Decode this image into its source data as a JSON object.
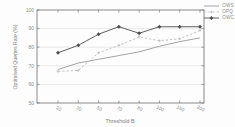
{
  "chart": {
    "xlabel": "Threshold B",
    "ylabel": "Optimised Queries Rate  (%)"
  },
  "chart_data": {
    "type": "line",
    "x": [
      20,
      30,
      50,
      70,
      80,
      100,
      150,
      200
    ],
    "x_tick_labels": [
      "20",
      "30",
      "50",
      "70",
      "80",
      "100",
      "150",
      "200"
    ],
    "xlabel": "Threshold B",
    "ylabel": "Optimised Queries Rate  (%)",
    "ylim": [
      50,
      100
    ],
    "yticks": [
      50,
      60,
      70,
      80,
      90,
      100
    ],
    "grid": true,
    "legend_position": "top-right-outside",
    "series": [
      {
        "name": "OWS",
        "values": [
          68,
          71.5,
          73.5,
          75.5,
          77.5,
          80.5,
          83,
          85
        ],
        "color": "#9a9a9a",
        "style": "solid",
        "marker": "none"
      },
      {
        "name": "OPQ",
        "values": [
          67,
          67.5,
          77,
          81,
          85.5,
          83.5,
          84.5,
          89
        ],
        "color": "#bfbfbf",
        "style": "dashed",
        "marker": "plus"
      },
      {
        "name": "OWC",
        "values": [
          77,
          81,
          87,
          91,
          87.5,
          91,
          91,
          91
        ],
        "color": "#4f4f4f",
        "style": "solid",
        "marker": "diamond"
      }
    ],
    "colors": {
      "frame": "#6b6b6b",
      "gridline": "#dcdcdc",
      "tick_text": "#8a8a8a"
    }
  }
}
